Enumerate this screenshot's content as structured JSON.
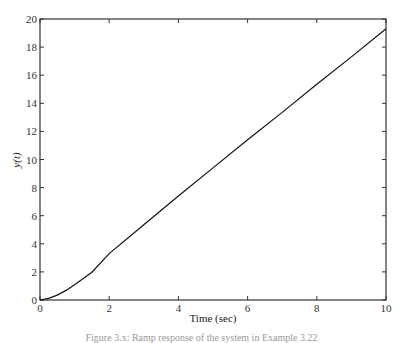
{
  "chart_data": {
    "type": "line",
    "title": "",
    "xlabel": "Time (sec)",
    "ylabel": "y(t)",
    "xlim": [
      0,
      10
    ],
    "ylim": [
      0,
      20
    ],
    "xticks": [
      0,
      2,
      4,
      6,
      8,
      10
    ],
    "yticks": [
      0,
      2,
      4,
      6,
      8,
      10,
      12,
      14,
      16,
      18,
      20
    ],
    "grid": false,
    "legend": null,
    "series": [
      {
        "name": "y(t)",
        "color": "#111111",
        "x": [
          0,
          0.25,
          0.5,
          0.75,
          1.0,
          1.25,
          1.5,
          2.0,
          3.0,
          4.0,
          5.0,
          6.0,
          7.0,
          8.0,
          9.0,
          10.0
        ],
        "y": [
          0,
          0.12,
          0.35,
          0.68,
          1.08,
          1.52,
          1.98,
          3.3,
          5.35,
          7.4,
          9.4,
          11.4,
          13.35,
          15.35,
          17.3,
          19.3
        ]
      }
    ]
  },
  "caption": "Figure 3.x: Ramp response of the system in Example 3.22"
}
